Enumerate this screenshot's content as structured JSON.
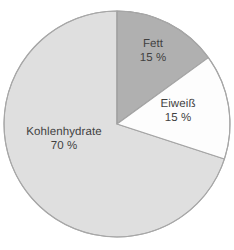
{
  "chart_data": {
    "type": "pie",
    "title": "",
    "subtitle": "",
    "xlabel": "",
    "ylabel": "",
    "legend_position": "none",
    "grid": false,
    "unit": "%",
    "start_angle_deg": 0,
    "direction": "clockwise",
    "categories": [
      "Fett",
      "Eiweiß",
      "Kohlenhydrate"
    ],
    "values": [
      15,
      15,
      70
    ],
    "slices": [
      {
        "label": "Fett",
        "value": 15,
        "value_text": "15 %",
        "color": "#a8a8a8",
        "stroke": "#8d8d8d",
        "start_deg": 0,
        "end_deg": 54
      },
      {
        "label": "Eiweiß",
        "value": 15,
        "value_text": "15 %",
        "color": "#fdfdfd",
        "stroke": "#9a9a9a",
        "start_deg": 54,
        "end_deg": 108
      },
      {
        "label": "Kohlenhydrate",
        "value": 70,
        "value_text": "70 %",
        "color": "#dcdcdc",
        "stroke": "#a0a0a0",
        "start_deg": 108,
        "end_deg": 360
      }
    ]
  },
  "figure": {
    "background": "#ffffff",
    "text_color": "#2b2b2b",
    "center_x": 117,
    "center_y": 124,
    "radius": 113
  }
}
